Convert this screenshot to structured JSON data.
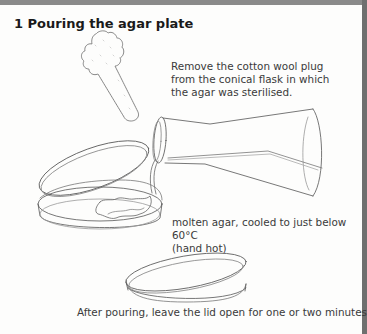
{
  "figure": {
    "title": "1  Pouring the agar plate",
    "captions": {
      "plug_line1": "Remove the cotton wool plug",
      "plug_line2": "from the conical flask in which",
      "plug_line3": "the agar was sterilised.",
      "agar_line1": "molten agar, cooled to just below 60°C",
      "agar_line2": "(hand hot)",
      "after": "After pouring, leave the lid open for one or two minutes"
    },
    "illustrations": [
      "cotton-wool-plug",
      "conical-flask-pouring",
      "petri-dish-lid-raised",
      "petri-dish-closed"
    ]
  },
  "colors": {
    "frame": "#8a8a8a",
    "background": "#fdfdfc",
    "line_art": "#555555",
    "text": "#3a3a3a"
  }
}
